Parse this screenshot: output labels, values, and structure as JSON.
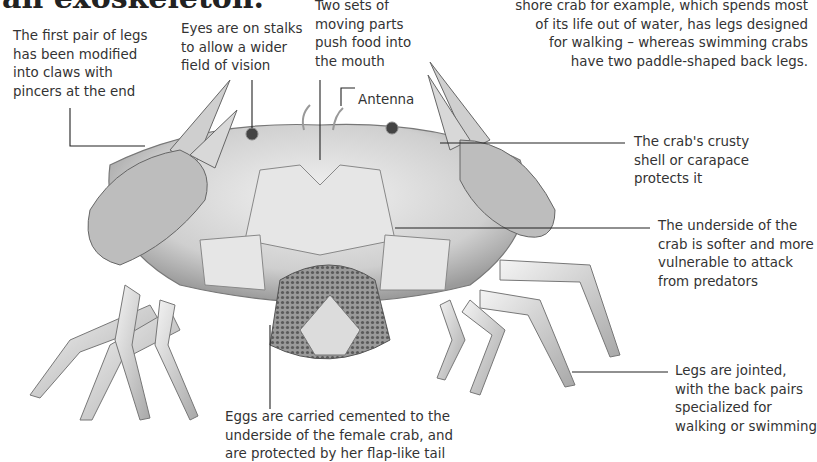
{
  "title": "an exoskeleton.",
  "intro_text": "shore crab for example, which spends most\nof its life out of water, has legs designed\nfor walking – whereas swimming crabs\nhave two paddle-shaped back legs.",
  "labels": {
    "claws": "The first pair of legs\nhas been modified\ninto claws with\npincers at the end",
    "eyes": "Eyes are on stalks\nto allow a wider\nfield of vision",
    "mouthparts": "Two sets of\nmoving parts\npush food into\nthe mouth",
    "antenna": "Antenna",
    "shell": "The crab's crusty\nshell or carapace\nprotects it",
    "underside": "The underside of the\ncrab is softer and more\nvulnerable to attack\nfrom predators",
    "legs": "Legs are jointed,\nwith the back pairs\nspecialized for\nwalking or swimming",
    "eggs": "Eggs are carried cemented to the\nunderside of the female crab, and\nare protected by her flap-like tail"
  },
  "colors": {
    "shell": "#cfcfcf",
    "shell_dark": "#8a8a8a",
    "eggs": "#6d6d6d",
    "leader": "#222222"
  }
}
